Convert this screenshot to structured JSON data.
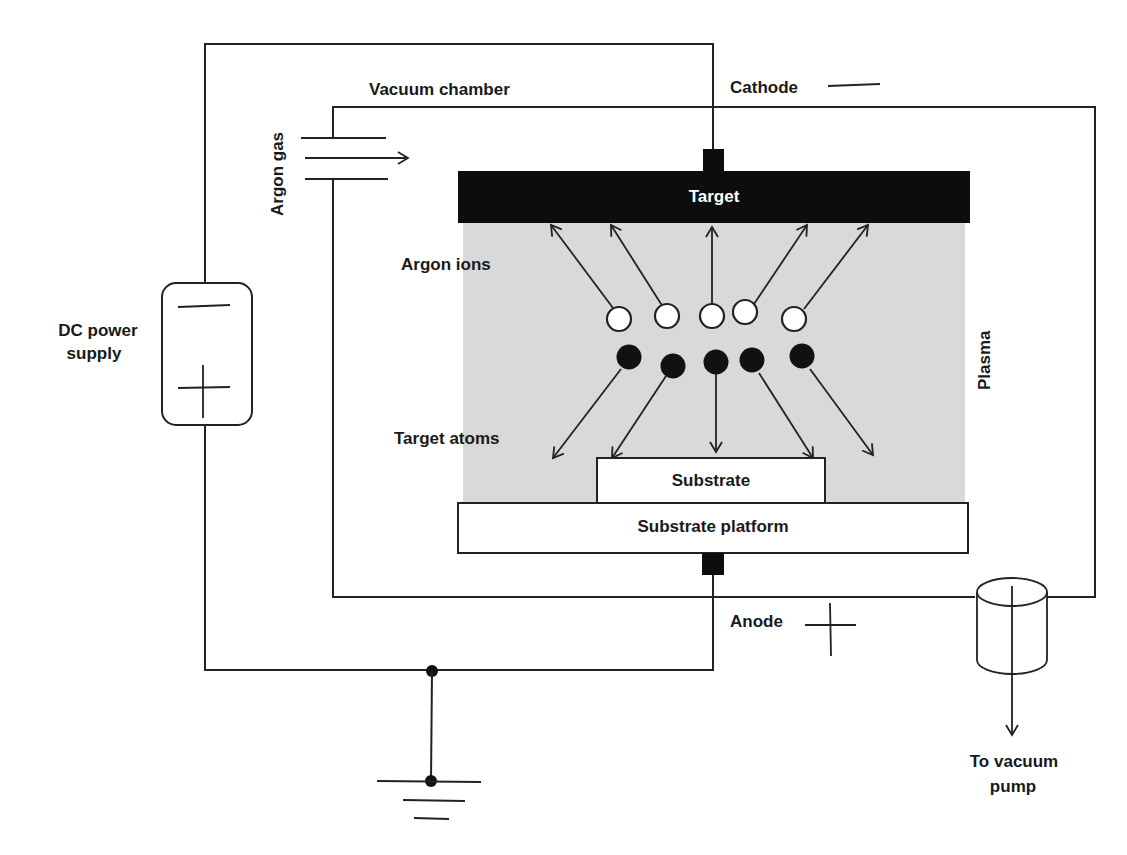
{
  "diagram": {
    "labels": {
      "vacuum_chamber": "Vacuum chamber",
      "cathode": "Cathode",
      "cathode_sign": "—",
      "argon_gas": "Argon gas",
      "target": "Target",
      "argon_ions": "Argon ions",
      "target_atoms": "Target atoms",
      "plasma": "Plasma",
      "substrate": "Substrate",
      "substrate_platform": "Substrate platform",
      "anode": "Anode",
      "anode_sign": "+",
      "dc_power_supply_line1": "DC power",
      "dc_power_supply_line2": "supply",
      "vacuum_pump_line1": "To vacuum",
      "vacuum_pump_line2": "pump"
    },
    "components": [
      {
        "id": "dc-power-supply",
        "terminals": [
          "-",
          "+"
        ]
      },
      {
        "id": "vacuum-chamber"
      },
      {
        "id": "target",
        "electrode": "cathode"
      },
      {
        "id": "substrate-platform",
        "electrode": "anode"
      },
      {
        "id": "substrate"
      },
      {
        "id": "plasma-region"
      },
      {
        "id": "argon-gas-inlet"
      },
      {
        "id": "vacuum-pump-outlet"
      },
      {
        "id": "ground"
      }
    ],
    "particles": {
      "argon_ions_count": 5,
      "target_atoms_count": 5
    },
    "colors": {
      "line": "#222222",
      "target_fill": "#0d0d0d",
      "plasma_fill": "#d9d9d9",
      "ion_fill": "#ffffff",
      "atom_fill": "#111111",
      "background": "#ffffff"
    }
  }
}
